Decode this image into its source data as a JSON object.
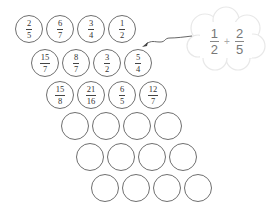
{
  "diagram": {
    "rows": [
      {
        "cells": [
          {
            "num": "2",
            "den": "5"
          },
          {
            "num": "6",
            "den": "7"
          },
          {
            "num": "3",
            "den": "4"
          },
          {
            "num": "1",
            "den": "2"
          }
        ]
      },
      {
        "cells": [
          {
            "num": "15",
            "den": "7"
          },
          {
            "num": "8",
            "den": "7"
          },
          {
            "num": "3",
            "den": "2"
          },
          {
            "num": "5",
            "den": "4"
          }
        ]
      },
      {
        "cells": [
          {
            "num": "15",
            "den": "8"
          },
          {
            "num": "21",
            "den": "16"
          },
          {
            "num": "6",
            "den": "5"
          },
          {
            "num": "12",
            "den": "7"
          }
        ]
      },
      {
        "cells": [
          {},
          {},
          {},
          {}
        ]
      },
      {
        "cells": [
          {},
          {},
          {},
          {}
        ]
      },
      {
        "cells": [
          {},
          {},
          {},
          {}
        ]
      }
    ],
    "cloud": {
      "left": {
        "num": "1",
        "den": "2"
      },
      "operator": "+",
      "right": {
        "num": "2",
        "den": "5"
      }
    },
    "colors": {
      "circle_stroke": "#6f6f6f",
      "cloud_stroke": "#e6e6e6",
      "cloud_text": "#777777",
      "arrow": "#555555"
    }
  }
}
